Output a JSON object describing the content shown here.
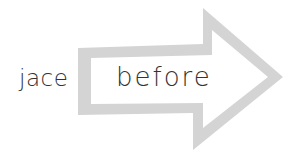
{
  "diagram": {
    "left_label": "jace",
    "arrow_label": "before",
    "arrow_direction": "right",
    "colors": {
      "arrow_outline": "#d4d4d4",
      "arrow_fill": "#ffffff",
      "text": "#333333",
      "background": "#ffffff"
    }
  }
}
